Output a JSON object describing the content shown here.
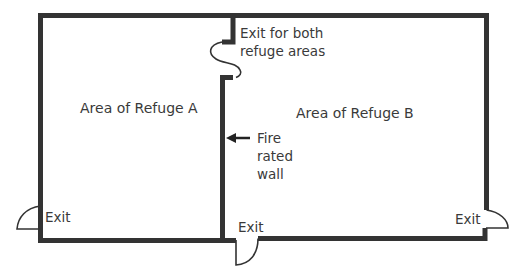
{
  "diagram": {
    "type": "floor-plan",
    "rooms": [
      {
        "id": "A",
        "label": "Area of Refuge A"
      },
      {
        "id": "B",
        "label": "Area of Refuge B"
      }
    ],
    "annotations": {
      "shared_exit_line1": "Exit for both",
      "shared_exit_line2": "refuge areas",
      "fire_wall_line1": "Fire",
      "fire_wall_line2": "rated",
      "fire_wall_line3": "wall"
    },
    "exits": [
      {
        "id": "exit-left",
        "label": "Exit"
      },
      {
        "id": "exit-bottom-center",
        "label": "Exit"
      },
      {
        "id": "exit-right",
        "label": "Exit"
      }
    ],
    "colors": {
      "wall": "#333333",
      "wall_edge": "#555555",
      "text": "#3a3a3a",
      "background": "#ffffff"
    }
  }
}
